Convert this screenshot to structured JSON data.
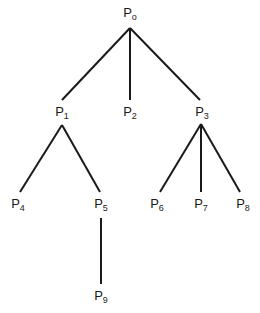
{
  "diagram": {
    "type": "tree",
    "line_color": "#1a1a1a",
    "nodes": [
      {
        "id": "P0",
        "base": "P",
        "sub": "o",
        "x": 130,
        "y": 14
      },
      {
        "id": "P1",
        "base": "P",
        "sub": "1",
        "x": 62,
        "y": 113
      },
      {
        "id": "P2",
        "base": "P",
        "sub": "2",
        "x": 130,
        "y": 113
      },
      {
        "id": "P3",
        "base": "P",
        "sub": "3",
        "x": 202,
        "y": 113
      },
      {
        "id": "P4",
        "base": "P",
        "sub": "4",
        "x": 18,
        "y": 205
      },
      {
        "id": "P5",
        "base": "P",
        "sub": "5",
        "x": 101,
        "y": 205
      },
      {
        "id": "P6",
        "base": "P",
        "sub": "6",
        "x": 157,
        "y": 205
      },
      {
        "id": "P7",
        "base": "P",
        "sub": "7",
        "x": 201,
        "y": 205
      },
      {
        "id": "P8",
        "base": "P",
        "sub": "8",
        "x": 243,
        "y": 205
      },
      {
        "id": "P9",
        "base": "P",
        "sub": "9",
        "x": 101,
        "y": 297
      }
    ],
    "edges": [
      {
        "from": "P0",
        "to": "P1",
        "x1": 130,
        "y1": 28,
        "x2": 62,
        "y2": 100
      },
      {
        "from": "P0",
        "to": "P2",
        "x1": 130,
        "y1": 28,
        "x2": 130,
        "y2": 100
      },
      {
        "from": "P0",
        "to": "P3",
        "x1": 130,
        "y1": 28,
        "x2": 200,
        "y2": 100
      },
      {
        "from": "P1",
        "to": "P4",
        "x1": 62,
        "y1": 125,
        "x2": 20,
        "y2": 192
      },
      {
        "from": "P1",
        "to": "P5",
        "x1": 62,
        "y1": 125,
        "x2": 100,
        "y2": 192
      },
      {
        "from": "P3",
        "to": "P6",
        "x1": 201,
        "y1": 124,
        "x2": 160,
        "y2": 192
      },
      {
        "from": "P3",
        "to": "P7",
        "x1": 201,
        "y1": 124,
        "x2": 201,
        "y2": 192
      },
      {
        "from": "P3",
        "to": "P8",
        "x1": 201,
        "y1": 124,
        "x2": 240,
        "y2": 192
      },
      {
        "from": "P5",
        "to": "P9",
        "x1": 101,
        "y1": 218,
        "x2": 101,
        "y2": 284
      }
    ]
  }
}
